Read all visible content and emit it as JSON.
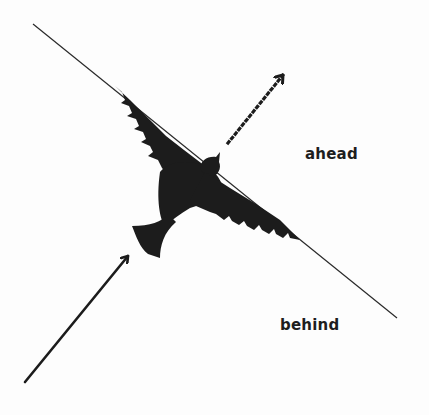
{
  "diagram": {
    "labels": {
      "ahead": "ahead",
      "behind": "behind"
    },
    "elements": {
      "boundary_line": {
        "from": [
          33,
          24
        ],
        "to": [
          397,
          318
        ],
        "style": "thin solid"
      },
      "bird": {
        "shape": "silhouette",
        "fill": "#1c1c1c",
        "orientation": "flying up-right"
      },
      "incoming_arrow": {
        "from": [
          25,
          382
        ],
        "to": [
          130,
          254
        ],
        "style": "solid",
        "meaning": "path behind"
      },
      "outgoing_arrow": {
        "from": [
          228,
          143
        ],
        "to": [
          285,
          73
        ],
        "style": "dotted",
        "meaning": "path ahead"
      }
    },
    "colors": {
      "ink": "#1c1c1c",
      "line": "#2a2a2a",
      "background": "#ffffff"
    }
  }
}
